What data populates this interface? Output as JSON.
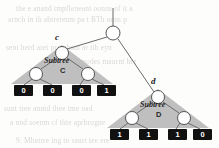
{
  "figure": {
    "background_color": "#fdfdfc",
    "triangle_color": "#bfbfbf",
    "node_fill": "#ffffff",
    "node_stroke": "#555555",
    "edge_color": "#666666",
    "leaf_fill": "#111111",
    "leaf_text_color": "#ffffff"
  },
  "root": {
    "label": "",
    "cx": 113,
    "cy": 33,
    "r": 7
  },
  "stem": {
    "x": 113,
    "y_top": 8,
    "y_bottom": 26
  },
  "subtrees": [
    {
      "id": "C",
      "node_label": "c",
      "caption_word": "Subtree",
      "caption_letter": "C",
      "apex": {
        "cx": 62,
        "cy": 53,
        "r": 6.5
      },
      "children": [
        {
          "cx": 36,
          "cy": 74,
          "r": 6.5
        },
        {
          "cx": 88,
          "cy": 74,
          "r": 6.5
        }
      ],
      "triangle": {
        "apex_x": 62,
        "apex_y": 45,
        "left_x": 11,
        "right_x": 113,
        "base_y": 84
      },
      "leaves": [
        {
          "value": "0",
          "x": 14
        },
        {
          "value": "0",
          "x": 43
        },
        {
          "value": "0",
          "x": 72
        },
        {
          "value": "1",
          "x": 97
        }
      ],
      "leaf_y": 85
    },
    {
      "id": "D",
      "node_label": "d",
      "caption_word": "Subtree",
      "caption_letter": "D",
      "apex": {
        "cx": 158,
        "cy": 97,
        "r": 6.5
      },
      "children": [
        {
          "cx": 132,
          "cy": 118,
          "r": 6.5
        },
        {
          "cx": 184,
          "cy": 118,
          "r": 6.5
        }
      ],
      "triangle": {
        "apex_x": 158,
        "apex_y": 89,
        "left_x": 107,
        "right_x": 209,
        "base_y": 128
      },
      "leaves": [
        {
          "value": "1",
          "x": 110
        },
        {
          "value": "1",
          "x": 139
        },
        {
          "value": "1",
          "x": 168
        },
        {
          "value": "0",
          "x": 193
        }
      ],
      "leaf_y": 129
    }
  ],
  "labels": {
    "c_label": {
      "text": "c",
      "x": 55,
      "y": 38
    },
    "d_label": {
      "text": "d",
      "x": 151,
      "y": 82
    },
    "subtree_c_word": {
      "text": "Subtree",
      "x": 44,
      "y": 62
    },
    "subtree_c_letter": {
      "text": "C",
      "x": 60,
      "y": 72
    },
    "subtree_d_word": {
      "text": "Subtree",
      "x": 140,
      "y": 106
    },
    "subtree_d_letter": {
      "text": "D",
      "x": 156,
      "y": 116
    }
  },
  "background_text": {
    "line1": "the e anand tmpfleneant oonns of it a",
    "line2": "arnch in th abtretenm pa t BTh anns p",
    "line3": "sent herd aret prombsm ar tth eyn",
    "line4": "tha lef nodes maurnt bre",
    "line5": "sunt tree anntd thee tme oad",
    "line6": "a nnd soenm cf thte aprbrogne",
    "line7": "9. Mhetrre ing to saurt tee ere"
  }
}
